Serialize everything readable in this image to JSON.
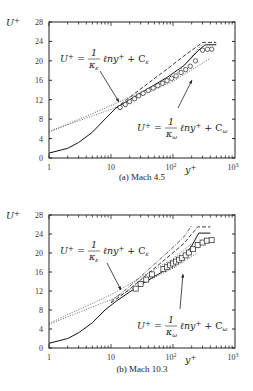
{
  "chart_data": [
    {
      "type": "line",
      "title": "(a) Mach 4.5",
      "xlabel": "y+",
      "ylabel": "U+",
      "xscale": "log",
      "xlim": [
        1,
        1000
      ],
      "ylim": [
        0,
        28
      ],
      "xticks": [
        "1",
        "10",
        "10^2",
        "10^3"
      ],
      "yticks": [
        "0",
        "4",
        "8",
        "12",
        "16",
        "20",
        "24",
        "28"
      ],
      "annotations": [
        {
          "text": "U+ = (1/κε) ℓny+ + Cε",
          "points_to": [
            13,
            11.5
          ]
        },
        {
          "text": "U+ = (1/κω) ℓny+ + Cω",
          "points_to": [
            160,
            18.5
          ]
        }
      ],
      "series": [
        {
          "name": "solid (DNS)",
          "style": "solid",
          "x": [
            1,
            2,
            3,
            5,
            8,
            12,
            20,
            40,
            80,
            150,
            250,
            330,
            500
          ],
          "y": [
            1.0,
            2.0,
            3.2,
            5.3,
            8.0,
            10.3,
            12.0,
            14.3,
            16.6,
            19.0,
            22.0,
            23.3,
            23.3
          ]
        },
        {
          "name": "dashed",
          "style": "dashed",
          "x": [
            12,
            20,
            40,
            80,
            150,
            300,
            500
          ],
          "y": [
            10.3,
            12.5,
            15.4,
            18.3,
            21.0,
            23.8,
            23.8
          ]
        },
        {
          "name": "dotted ε log-law",
          "style": "dotted",
          "x": [
            1,
            10,
            100,
            300
          ],
          "y": [
            5.3,
            10.8,
            16.5,
            23.5
          ]
        },
        {
          "name": "dotted ω log-law",
          "style": "dotted",
          "x": [
            1,
            10,
            100,
            400
          ],
          "y": [
            5.5,
            10.0,
            15.8,
            20.5
          ]
        },
        {
          "name": "circles (data)",
          "style": "marker-circle",
          "x": [
            14,
            17,
            20,
            24,
            28,
            33,
            40,
            48,
            57,
            68,
            80,
            95,
            112,
            135,
            160,
            190,
            230,
            300,
            360,
            420
          ],
          "y": [
            10.4,
            11.0,
            11.6,
            12.2,
            12.8,
            13.3,
            13.9,
            14.4,
            14.9,
            15.4,
            15.9,
            16.4,
            16.9,
            17.6,
            18.2,
            18.9,
            20.0,
            22.2,
            22.4,
            22.4
          ]
        }
      ]
    },
    {
      "type": "line",
      "title": "(b) Mach 10.3",
      "xlabel": "y+",
      "ylabel": "U+",
      "xscale": "log",
      "xlim": [
        1,
        1000
      ],
      "ylim": [
        0,
        28
      ],
      "xticks": [
        "1",
        "10",
        "10^2",
        "10^3"
      ],
      "yticks": [
        "0",
        "4",
        "8",
        "12",
        "16",
        "20",
        "24",
        "28"
      ],
      "annotations": [
        {
          "text": "U+ = (1/κε) ℓny+ + Cε",
          "points_to": [
            14,
            12.5
          ]
        },
        {
          "text": "U+ = (1/κω) ℓny+ + Cω",
          "points_to": [
            140,
            18.5
          ]
        }
      ],
      "series": [
        {
          "name": "solid (DNS)",
          "style": "solid",
          "x": [
            1,
            2,
            3,
            5,
            8,
            12,
            20,
            40,
            80,
            150,
            200,
            260,
            400
          ],
          "y": [
            1.0,
            2.0,
            3.2,
            5.3,
            8.0,
            9.8,
            11.8,
            14.3,
            16.6,
            19.3,
            21.5,
            24.2,
            24.2
          ]
        },
        {
          "name": "dashed",
          "style": "dashed",
          "x": [
            10,
            20,
            40,
            80,
            150,
            250,
            400
          ],
          "y": [
            9.5,
            12.4,
            15.7,
            19.0,
            22.0,
            25.5,
            25.5
          ]
        },
        {
          "name": "dash-dot",
          "style": "dashdot",
          "x": [
            10,
            20,
            40,
            80,
            150,
            200
          ],
          "y": [
            9.8,
            13.0,
            16.5,
            20.0,
            23.4,
            25.8
          ]
        },
        {
          "name": "dotted ε log-law",
          "style": "dotted",
          "x": [
            1,
            10,
            100,
            200
          ],
          "y": [
            5.2,
            11.2,
            18.8,
            22.0
          ]
        },
        {
          "name": "dotted ω log-law",
          "style": "dotted",
          "x": [
            1,
            10,
            100,
            250
          ],
          "y": [
            5.0,
            10.2,
            16.8,
            20.0
          ]
        },
        {
          "name": "squares (data)",
          "style": "marker-square",
          "x": [
            25,
            30,
            37,
            46,
            70,
            80,
            90,
            100,
            112,
            125,
            140,
            160,
            180,
            210,
            250,
            300,
            350,
            420
          ],
          "y": [
            12.5,
            13.5,
            14.4,
            15.5,
            16.6,
            17.0,
            17.4,
            17.8,
            18.2,
            18.6,
            19.0,
            19.5,
            20.1,
            20.8,
            21.7,
            22.2,
            22.6,
            22.7
          ]
        }
      ]
    }
  ],
  "panels": [
    {
      "caption": "(a) Mach 4.5",
      "ylabel": "U+",
      "xlabel": "y+"
    },
    {
      "caption": "(b) Mach 10.3",
      "ylabel": "U+",
      "xlabel": "y+"
    }
  ]
}
